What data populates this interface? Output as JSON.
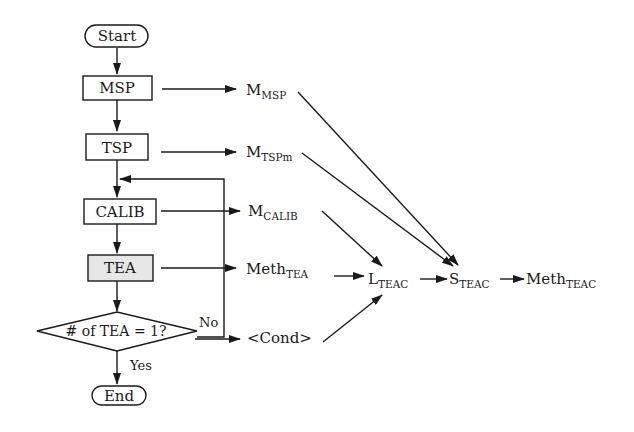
{
  "flowchart": {
    "start": "Start",
    "end": "End",
    "steps": [
      "MSP",
      "TSP",
      "CALIB",
      "TEA"
    ],
    "decision": "# of TEA = 1?",
    "decision_no": "No",
    "decision_yes": "Yes"
  },
  "outputs": {
    "msp": {
      "base": "M",
      "sub": "MSP"
    },
    "tsp": {
      "base": "M",
      "sub": "TSPm"
    },
    "calib": {
      "base": "M",
      "sub": "CALIB"
    },
    "tea": {
      "base": "Meth",
      "sub": "TEA"
    },
    "cond": {
      "base": "<Cond>"
    }
  },
  "results": {
    "l_teac": {
      "base": "L",
      "sub": "TEAC"
    },
    "s_teac": {
      "base": "S",
      "sub": "TEAC"
    },
    "meth_teac": {
      "base": "Meth",
      "sub": "TEAC"
    }
  },
  "colors": {
    "stroke": "#1a1a1a",
    "tea_fill": "#e6e6e6",
    "background": "#ffffff"
  }
}
